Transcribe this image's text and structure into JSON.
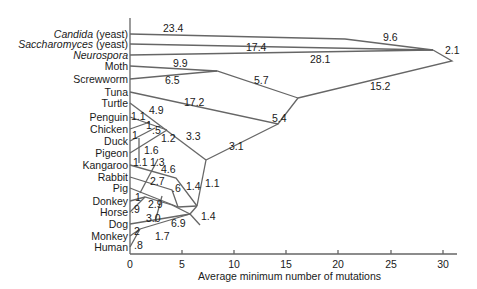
{
  "figure": {
    "type": "phylogenetic_tree",
    "xlabel": "Average minimum number of mutations",
    "x_ticks": [
      "0",
      "5",
      "10",
      "15",
      "20",
      "25",
      "30"
    ],
    "line_color": "#666666",
    "text_color": "#1a1a1a"
  },
  "taxa": [
    {
      "name": "Candida",
      "suffix": " (yeast)",
      "italic": true
    },
    {
      "name": "Saccharomyces",
      "suffix": " (yeast)",
      "italic": true
    },
    {
      "name": "Neurospora",
      "suffix": "",
      "italic": true
    },
    {
      "name": "Moth",
      "suffix": "",
      "italic": false
    },
    {
      "name": "Screwworm",
      "suffix": "",
      "italic": false
    },
    {
      "name": "Tuna",
      "suffix": "",
      "italic": false
    },
    {
      "name": "Turtle",
      "suffix": "",
      "italic": false
    },
    {
      "name": "Penguin",
      "suffix": "",
      "italic": false
    },
    {
      "name": "Chicken",
      "suffix": "",
      "italic": false
    },
    {
      "name": "Duck",
      "suffix": "",
      "italic": false
    },
    {
      "name": "Pigeon",
      "suffix": "",
      "italic": false
    },
    {
      "name": "Kangaroo",
      "suffix": "",
      "italic": false
    },
    {
      "name": "Rabbit",
      "suffix": "",
      "italic": false
    },
    {
      "name": "Pig",
      "suffix": "",
      "italic": false
    },
    {
      "name": "Donkey",
      "suffix": "",
      "italic": false
    },
    {
      "name": "Horse",
      "suffix": "",
      "italic": false
    },
    {
      "name": "Dog",
      "suffix": "",
      "italic": false
    },
    {
      "name": "Monkey",
      "suffix": "",
      "italic": false
    },
    {
      "name": "Human",
      "suffix": "",
      "italic": false
    }
  ],
  "branch_lengths": {
    "candida": "23.4",
    "yeast_clade": "9.6",
    "saccharomyces": "17.4",
    "neurospora": "28.1",
    "fungi_root": "2.1",
    "moth": "9.9",
    "screwworm": "6.5",
    "insects": "5.7",
    "animal_root": "15.2",
    "tuna": "17.2",
    "vertebrates": "5.4",
    "turtle": "4.9",
    "penguin": "1.1",
    "chicken": "1",
    "duck": "1",
    "chicken_duck": ".5",
    "galliform": "1.2",
    "pigeon": "1.6",
    "birds": "3.3",
    "amniotes": "3.1",
    "kangaroo": "1.1",
    "rabbit": "1.3",
    "kangaroo_branch": "4.6",
    "pig": "2.7",
    "pig_branch": ".6",
    "placental_a": "1.4",
    "mammals": "1.1",
    "donkey": "1",
    "horse": ".9",
    "equids": "2.9",
    "dog": "3.0",
    "primate_branch": "6.9",
    "monkey": "2",
    "human": ".8",
    "primates": "1.7",
    "placental_b": "1.4"
  }
}
